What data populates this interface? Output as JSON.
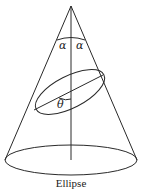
{
  "figure": {
    "caption": "Ellipse",
    "labels": {
      "alpha_left": "α",
      "alpha_right": "α",
      "theta": "θ"
    },
    "colors": {
      "line": "#2a2a2a",
      "background": "#ffffff"
    }
  }
}
